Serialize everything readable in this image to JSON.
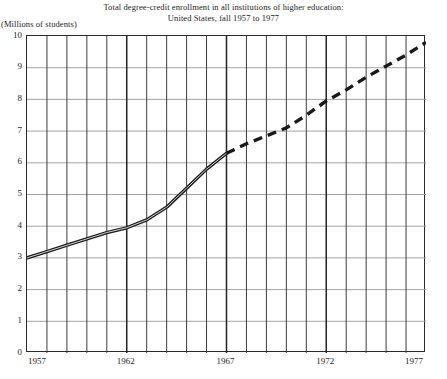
{
  "chart_data": {
    "type": "line",
    "title": "Total degree-credit enrollment in all institutions of higher education:",
    "subtitle": "United States, fall 1957 to 1977",
    "ylabel": "(Millions of students)",
    "xlabel": "",
    "ylim": [
      0,
      10
    ],
    "xlim": [
      1957,
      1977
    ],
    "grid": true,
    "legend_position": "none",
    "y_ticks": [
      "10",
      "9",
      "8",
      "7",
      "6",
      "5",
      "4",
      "3",
      "2",
      "1",
      "0"
    ],
    "y_tick_values": [
      10,
      9,
      8,
      7,
      6,
      5,
      4,
      3,
      2,
      1,
      0
    ],
    "x_ticks": [
      "1957",
      "1962",
      "1967",
      "1972",
      "1977"
    ],
    "x_tick_values": [
      1957,
      1962,
      1967,
      1972,
      1977
    ],
    "x_gridline_years": [
      1957,
      1958,
      1959,
      1960,
      1961,
      1962,
      1963,
      1964,
      1965,
      1966,
      1967,
      1968,
      1969,
      1970,
      1971,
      1972,
      1973,
      1974,
      1975,
      1976,
      1977
    ],
    "series": [
      {
        "name": "Actual enrollment",
        "style": "solid",
        "x": [
          1957,
          1958,
          1959,
          1960,
          1961,
          1962,
          1963,
          1964,
          1965,
          1966,
          1967
        ],
        "values": [
          3.0,
          3.2,
          3.4,
          3.6,
          3.8,
          3.95,
          4.2,
          4.6,
          5.2,
          5.8,
          6.3
        ]
      },
      {
        "name": "Projected enrollment",
        "style": "dashed",
        "x": [
          1967,
          1968,
          1969,
          1970,
          1971,
          1972,
          1973,
          1974,
          1975,
          1976,
          1977
        ],
        "values": [
          6.3,
          6.6,
          6.85,
          7.1,
          7.5,
          7.95,
          8.3,
          8.7,
          9.05,
          9.4,
          9.8
        ]
      }
    ],
    "colors": {
      "line": "#1a1a1a",
      "grid_major": "#3c3c3c",
      "grid_minor": "#9a9a9a",
      "frame": "#2a2a2a",
      "background": "#ffffff"
    }
  }
}
